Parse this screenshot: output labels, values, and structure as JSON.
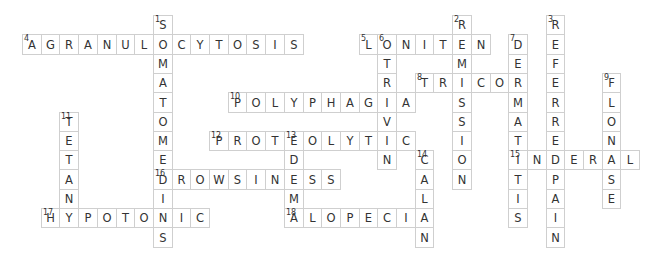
{
  "puzzle": {
    "type": "crossword",
    "grid": {
      "origin_x": 22,
      "origin_y": 15,
      "cell_w": 18.7,
      "cell_h": 19.3
    },
    "colors": {
      "border": "#cfcfcf",
      "text": "#333333",
      "background": "#ffffff"
    },
    "entries": [
      {
        "number": 1,
        "direction": "down",
        "answer": "SOMATOMEDINS",
        "row": 0,
        "col": 7
      },
      {
        "number": 2,
        "direction": "down",
        "answer": "REMISSION",
        "row": 0,
        "col": 23
      },
      {
        "number": 3,
        "direction": "down",
        "answer": "REFERREDPAIN",
        "row": 0,
        "col": 28
      },
      {
        "number": 4,
        "direction": "across",
        "answer": "AGRANULOCYTOSIS",
        "row": 1,
        "col": 0
      },
      {
        "number": 5,
        "direction": "across",
        "answer": "LONITEN",
        "row": 1,
        "col": 18
      },
      {
        "number": 6,
        "direction": "down",
        "answer": "OTRIVIN",
        "row": 1,
        "col": 19
      },
      {
        "number": 7,
        "direction": "down",
        "answer": "DERMATITIS",
        "row": 1,
        "col": 26
      },
      {
        "number": 8,
        "direction": "across",
        "answer": "TRICOR",
        "row": 3,
        "col": 21
      },
      {
        "number": 9,
        "direction": "down",
        "answer": "FLONASE",
        "row": 3,
        "col": 31
      },
      {
        "number": 10,
        "direction": "across",
        "answer": "POLYPHAGIA",
        "row": 4,
        "col": 11
      },
      {
        "number": 11,
        "direction": "down",
        "answer": "TETANY",
        "row": 5,
        "col": 2
      },
      {
        "number": 12,
        "direction": "across",
        "answer": "PROTEOLYTIC",
        "row": 6,
        "col": 10
      },
      {
        "number": 13,
        "direction": "down",
        "answer": "EDEMA",
        "row": 6,
        "col": 14
      },
      {
        "number": 14,
        "direction": "down",
        "answer": "CALAN",
        "row": 7,
        "col": 21
      },
      {
        "number": 15,
        "direction": "across",
        "answer": "INDERAL",
        "row": 7,
        "col": 26
      },
      {
        "number": 16,
        "direction": "across",
        "answer": "DROWSINESS",
        "row": 8,
        "col": 7
      },
      {
        "number": 17,
        "direction": "across",
        "answer": "HYPOTONIC",
        "row": 10,
        "col": 1
      },
      {
        "number": 18,
        "direction": "across",
        "answer": "ALOPECIA",
        "row": 10,
        "col": 14
      }
    ]
  }
}
